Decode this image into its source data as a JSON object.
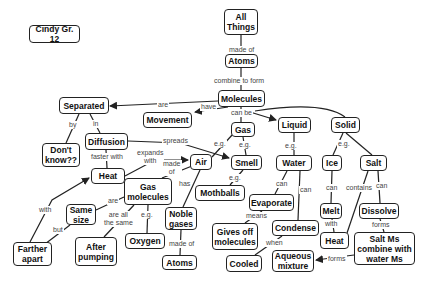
{
  "title": "Cindy Gr. 12",
  "colors": {
    "node_border": "#222222",
    "line": "#222222",
    "link_text": "#444444",
    "background": "#ffffff"
  },
  "nodes": {
    "cindy": "Cindy Gr. 12",
    "all_things": "All\nThings",
    "atoms_top": "Atoms",
    "molecules": "Molecules",
    "separated": "Separated",
    "movement": "Movement",
    "gas": "Gas",
    "liquid": "Liquid",
    "solid": "Solid",
    "diffusion": "Diffusion",
    "dont_know": "Don't\nknow??",
    "heat_left": "Heat",
    "air": "Air",
    "smell": "Smell",
    "water": "Water",
    "ice": "Ice",
    "salt": "Salt",
    "gas_molecules": "Gas\nmolecules",
    "same_size": "Same\nsize",
    "mothballs": "Mothballs",
    "evaporate": "Evaporate",
    "melt": "Melt",
    "dissolve": "Dissolve",
    "noble_gases": "Noble\ngases",
    "oxygen": "Oxygen",
    "gives_off": "Gives off\nmolecules",
    "condense": "Condense",
    "heat_right": "Heat",
    "salt_ms": "Salt Ms\ncombine with\nwater Ms",
    "farther_apart": "Farther\napart",
    "after_pumping": "After\npumping",
    "atoms_bottom": "Atoms",
    "cooled": "Cooled",
    "aqueous": "Aqueous\nmixture"
  },
  "links": {
    "made_of": "made of",
    "combine_to_form": "combine to form",
    "are": "are",
    "have": "have",
    "can_be": "can be",
    "by": "by",
    "in": "in",
    "spreads": "spreads",
    "faster_with": "faster with",
    "expands_with": "expands\nwith",
    "made_of_air": "made\nof",
    "has": "has",
    "eg_gas_air": "e.g.",
    "eg_gas_smell": "e.g.",
    "eg_liquid": "e.g.",
    "eg_solid": "e.g.",
    "eg_smell": "e.g.",
    "can_water1": "can",
    "can_water2": "can",
    "can_ice": "can",
    "contains": "contains",
    "can_salt": "can",
    "means": "means",
    "when": "when",
    "with_melt": "with",
    "forms_dissolve": "forms",
    "forms_salt": "forms",
    "are_gm": "are",
    "are_all_same": "are all\nthe same",
    "eg_gm": "e.g.",
    "made_of_noble": "made of",
    "with_far": "with",
    "but": "but"
  }
}
